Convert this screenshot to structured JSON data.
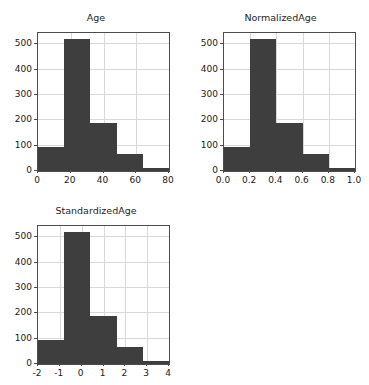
{
  "figure": {
    "background_color": "#ffffff",
    "bar_color": "#3e3e3e",
    "grid_color": "#d8d8d8",
    "axis_color": "#4d4d4d",
    "rows": 2,
    "cols": 2
  },
  "chart_data": [
    {
      "type": "bar",
      "name": "age-histogram",
      "title": "Age",
      "xlabel": "",
      "ylabel": "",
      "grid": true,
      "legend": false,
      "xlim": [
        0,
        80
      ],
      "ylim": [
        0,
        545
      ],
      "xticks": [
        0,
        20,
        40,
        60,
        80
      ],
      "xticklabels": [
        "0",
        "20",
        "40",
        "60",
        "80"
      ],
      "yticks": [
        0,
        100,
        200,
        300,
        400,
        500
      ],
      "yticklabels": [
        "0",
        "100",
        "200",
        "300",
        "400",
        "500"
      ],
      "bin_edges": [
        0,
        16,
        32,
        48,
        64,
        80
      ],
      "values": [
        95,
        520,
        188,
        68,
        12
      ]
    },
    {
      "type": "bar",
      "name": "normalizedage-histogram",
      "title": "NormalizedAge",
      "xlabel": "",
      "ylabel": "",
      "grid": true,
      "legend": false,
      "xlim": [
        0.0,
        1.0
      ],
      "ylim": [
        0,
        545
      ],
      "xticks": [
        0.0,
        0.2,
        0.4,
        0.6,
        0.8,
        1.0
      ],
      "xticklabels": [
        "0.0",
        "0.2",
        "0.4",
        "0.6",
        "0.8",
        "1.0"
      ],
      "yticks": [
        0,
        100,
        200,
        300,
        400,
        500
      ],
      "yticklabels": [
        "0",
        "100",
        "200",
        "300",
        "400",
        "500"
      ],
      "bin_edges": [
        0.0,
        0.2,
        0.4,
        0.6,
        0.8,
        1.0
      ],
      "values": [
        95,
        520,
        188,
        68,
        12
      ]
    },
    {
      "type": "bar",
      "name": "standardizedage-histogram",
      "title": "StandardizedAge",
      "xlabel": "",
      "ylabel": "",
      "grid": true,
      "legend": false,
      "xlim": [
        -2,
        4
      ],
      "ylim": [
        0,
        545
      ],
      "xticks": [
        -2,
        -1,
        0,
        1,
        2,
        3,
        4
      ],
      "xticklabels": [
        "-2",
        "-1",
        "0",
        "1",
        "2",
        "3",
        "4"
      ],
      "yticks": [
        0,
        100,
        200,
        300,
        400,
        500
      ],
      "yticklabels": [
        "0",
        "100",
        "200",
        "300",
        "400",
        "500"
      ],
      "bin_edges": [
        -2,
        -0.8,
        0.4,
        1.6,
        2.8,
        4
      ],
      "values": [
        95,
        520,
        188,
        68,
        12
      ]
    }
  ]
}
